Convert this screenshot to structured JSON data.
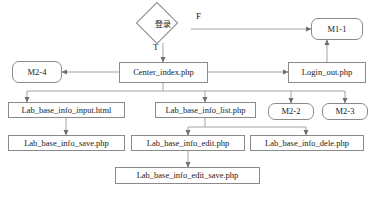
{
  "diagram": {
    "canvas": {
      "width": 373,
      "height": 199
    },
    "style": {
      "stroke": "#8a8a8a",
      "text": "#1a1a1a",
      "background": "#ffffff"
    },
    "nodes": {
      "login_decision": {
        "label": "登录",
        "shape": "diamond"
      },
      "m1_1": {
        "label": "M1-1",
        "shape": "rounded-rect"
      },
      "m2_4": {
        "label": "M2-4",
        "shape": "rounded-rect"
      },
      "center_index": {
        "label": "Center_index.php",
        "shape": "rect"
      },
      "login_out": {
        "label": "Login_out.php",
        "shape": "rect"
      },
      "info_input": {
        "label": "Lab_base_info_input.html",
        "shape": "rect"
      },
      "info_list": {
        "label": "Lab_base_info_list.php",
        "shape": "rect"
      },
      "m2_2": {
        "label": "M2-2",
        "shape": "rounded-rect"
      },
      "m2_3": {
        "label": "M2-3",
        "shape": "rounded-rect"
      },
      "info_save": {
        "label": "Lab_base_info_save.php",
        "shape": "rect"
      },
      "info_edit": {
        "label": "Lab_base_info_edit.php",
        "shape": "rect"
      },
      "info_dele": {
        "label": "Lab_base_info_dele.php",
        "shape": "rect"
      },
      "info_edit_save": {
        "label": "Lab_base_info_edit_save.php",
        "shape": "rect"
      }
    },
    "edge_labels": {
      "false_branch": "F",
      "true_branch": "T"
    }
  }
}
